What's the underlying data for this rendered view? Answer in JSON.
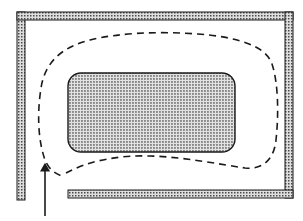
{
  "figure": {
    "type": "technical-line-diagram",
    "width": 303,
    "height": 221,
    "background_color": "#ffffff",
    "stroke_color": "#1a1a1a",
    "hatch_fill_color": "#d9d9d9",
    "hatch_dot_color": "#4d4d4d",
    "dashed_path_color": "#1a1a1a",
    "arrow_color": "#1a1a1a"
  },
  "enclosure": {
    "label": "outer-channel-walls",
    "wall_thickness": 8,
    "segments": [
      {
        "name": "left-wall",
        "x": 17,
        "y": 12,
        "width": 8,
        "height": 188
      },
      {
        "name": "top-wall",
        "x": 17,
        "y": 12,
        "width": 276,
        "height": 8
      },
      {
        "name": "right-wall",
        "x": 285,
        "y": 12,
        "width": 8,
        "height": 186
      },
      {
        "name": "bottom-wall",
        "x": 68,
        "y": 190,
        "width": 225,
        "height": 8
      }
    ],
    "inlet_gap": {
      "name": "bottom-left-inlet-gap",
      "x_start": 25,
      "x_end": 68,
      "y": 194
    }
  },
  "obstacle": {
    "label": "inner-rounded-block",
    "x": 68,
    "y": 73,
    "width": 167,
    "height": 79,
    "corner_radius": 13,
    "fill": "stippled"
  },
  "streamline": {
    "label": "recirculating-flow-path",
    "style": "dashed",
    "dash_pattern": "7 5",
    "stroke_width": 1.6,
    "path": "M 66 173 C 88 161, 118 155, 150 156 C 184 157, 218 164, 245 168 C 262 170, 274 160, 276 140 C 279 112, 278 82, 272 64 C 266 46, 238 37, 198 34 C 158 31, 118 33, 90 40 C 62 47, 45 62, 41 88 C 37 114, 38 140, 45 160 C 49 170, 56 174, 62 176"
  },
  "inflow_arrow": {
    "label": "inlet-flow-direction-arrow",
    "direction": "up",
    "x": 45,
    "y_tail": 216,
    "y_head": 167,
    "shaft_width": 1.6,
    "head_width": 9,
    "head_length": 13
  },
  "annotations": {
    "caption": "",
    "legend": []
  }
}
